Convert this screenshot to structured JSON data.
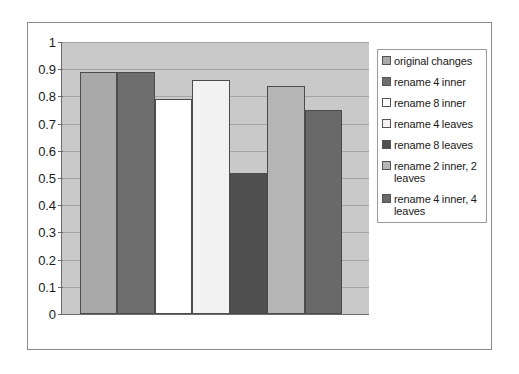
{
  "chart_data": {
    "type": "bar",
    "title": "",
    "subtitle": "",
    "xlabel": "",
    "ylabel": "",
    "ylim": [
      0,
      1
    ],
    "grid": true,
    "legend_position": "right",
    "categories": [
      "original changes",
      "rename 4 inner",
      "rename 8 inner",
      "rename 4 leaves",
      "rename 8 leaves",
      "rename 2 inner, 2 leaves",
      "rename 4 inner, 4 leaves"
    ],
    "values": [
      0.89,
      0.89,
      0.79,
      0.86,
      0.52,
      0.84,
      0.75
    ],
    "y_ticks": [
      "0",
      "0.1",
      "0.2",
      "0.3",
      "0.4",
      "0.5",
      "0.6",
      "0.7",
      "0.8",
      "0.9",
      "1"
    ],
    "bar_colors": [
      "#a9a9a9",
      "#6e6e6e",
      "#ffffff",
      "#f2f2f2",
      "#4f4f4f",
      "#b5b5b5",
      "#696969"
    ],
    "plot_background": "#c9c9c9"
  },
  "legend": {
    "items": [
      {
        "label": "original changes",
        "color": "#a9a9a9"
      },
      {
        "label": "rename 4 inner",
        "color": "#6e6e6e"
      },
      {
        "label": "rename 8 inner",
        "color": "#ffffff"
      },
      {
        "label": "rename 4 leaves",
        "color": "#f2f2f2"
      },
      {
        "label": "rename 8 leaves",
        "color": "#4f4f4f"
      },
      {
        "label": "rename 2 inner, 2 leaves",
        "color": "#b5b5b5"
      },
      {
        "label": "rename 4 inner, 4 leaves",
        "color": "#696969"
      }
    ]
  }
}
